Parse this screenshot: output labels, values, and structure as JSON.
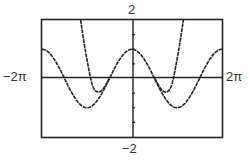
{
  "chart_data": {
    "type": "line",
    "title": "",
    "xlabel": "",
    "ylabel": "",
    "xlim": [
      -6.2832,
      6.2832
    ],
    "ylim": [
      -2,
      2
    ],
    "x_tick_labels": {
      "min": "−2π",
      "max": "2π"
    },
    "y_tick_labels": {
      "min": "−2",
      "max": "2"
    },
    "y_tick_step": 0.5,
    "grid": false,
    "legend": null,
    "series": [
      {
        "name": "cos-curve",
        "description": "y = cos x",
        "points": [
          [
            -6.2832,
            1
          ],
          [
            -5.5,
            0.71
          ],
          [
            -4.7124,
            0
          ],
          [
            -3.9,
            -0.73
          ],
          [
            -3.1416,
            -1
          ],
          [
            -2.4,
            -0.74
          ],
          [
            -1.5708,
            0
          ],
          [
            -0.8,
            0.7
          ],
          [
            0,
            1
          ],
          [
            0.8,
            0.7
          ],
          [
            1.5708,
            0
          ],
          [
            2.4,
            -0.74
          ],
          [
            3.1416,
            -1
          ],
          [
            3.9,
            -0.73
          ],
          [
            4.7124,
            0
          ],
          [
            5.5,
            0.71
          ],
          [
            6.2832,
            1
          ]
        ]
      },
      {
        "name": "steep-curve-left",
        "points": [
          [
            -3.59,
            2
          ],
          [
            -3.25,
            0.92
          ],
          [
            -2.9,
            0
          ],
          [
            -2.69,
            -0.37
          ],
          [
            -2.35,
            -0.5
          ],
          [
            -2.0,
            -0.37
          ],
          [
            -1.59,
            0
          ]
        ]
      },
      {
        "name": "steep-curve-right",
        "points": [
          [
            1.59,
            0
          ],
          [
            2.0,
            -0.37
          ],
          [
            2.35,
            -0.5
          ],
          [
            2.69,
            -0.37
          ],
          [
            2.9,
            0
          ],
          [
            3.25,
            0.92
          ],
          [
            3.59,
            2
          ]
        ]
      }
    ]
  },
  "labels": {
    "ymax": "2",
    "ymin": "−2",
    "xmin": "−2π",
    "xmax": "2π"
  }
}
